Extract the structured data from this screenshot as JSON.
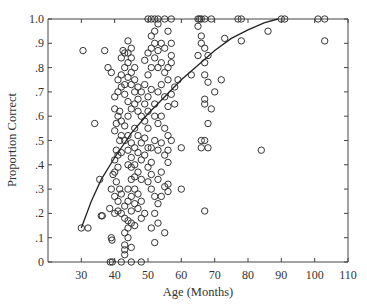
{
  "chart_data": {
    "type": "scatter",
    "title": "",
    "xlabel": "Age (Months)",
    "ylabel": "Proportion Correct",
    "xlim": [
      20,
      110
    ],
    "ylim": [
      0,
      1.0
    ],
    "x_ticks": [
      30,
      40,
      50,
      60,
      70,
      80,
      90,
      100,
      110
    ],
    "x_tick_labels": [
      "30",
      "40",
      "50",
      "60",
      "70",
      "80",
      "90",
      "100",
      "110"
    ],
    "y_ticks": [
      0,
      0.1,
      0.2,
      0.3,
      0.4,
      0.5,
      0.6,
      0.7,
      0.8,
      0.9,
      1.0
    ],
    "y_tick_labels": [
      "0",
      ".1",
      ".2",
      ".3",
      ".4",
      ".5",
      ".6",
      ".7",
      ".8",
      ".9",
      "1.0"
    ],
    "grid": false,
    "legend": null,
    "fit_curve": {
      "description": "monotone increasing fitted curve",
      "points": [
        [
          30,
          0.14
        ],
        [
          33,
          0.25
        ],
        [
          36,
          0.34
        ],
        [
          40,
          0.43
        ],
        [
          45,
          0.53
        ],
        [
          50,
          0.61
        ],
        [
          55,
          0.68
        ],
        [
          60,
          0.75
        ],
        [
          65,
          0.81
        ],
        [
          70,
          0.87
        ],
        [
          75,
          0.92
        ],
        [
          80,
          0.955
        ],
        [
          85,
          0.985
        ],
        [
          89,
          1.0
        ]
      ]
    },
    "series": [
      {
        "name": "children",
        "points": [
          [
            30,
            0.14
          ],
          [
            32,
            0.14
          ],
          [
            30.5,
            0.87
          ],
          [
            37,
            0.87
          ],
          [
            34,
            0.57
          ],
          [
            36,
            0.19
          ],
          [
            36.3,
            0.19
          ],
          [
            35.5,
            0.34
          ],
          [
            38,
            0.8
          ],
          [
            39,
            0.78
          ],
          [
            38.5,
            0.22
          ],
          [
            39,
            0.1
          ],
          [
            39.2,
            0.09
          ],
          [
            38.7,
            0.0
          ],
          [
            39.3,
            0.0
          ],
          [
            42,
            0.0
          ],
          [
            45,
            0.0
          ],
          [
            48,
            0.0
          ],
          [
            39.5,
            0.36
          ],
          [
            40,
            0.37
          ],
          [
            40.5,
            0.33
          ],
          [
            41,
            0.39
          ],
          [
            41.5,
            0.3
          ],
          [
            42,
            0.28
          ],
          [
            39,
            0.3
          ],
          [
            40,
            0.27
          ],
          [
            41,
            0.25
          ],
          [
            43,
            0.23
          ],
          [
            40,
            0.2
          ],
          [
            41,
            0.21
          ],
          [
            42,
            0.2
          ],
          [
            43,
            0.18
          ],
          [
            44,
            0.17
          ],
          [
            45,
            0.16
          ],
          [
            46,
            0.15
          ],
          [
            44,
            0.14
          ],
          [
            43,
            0.12
          ],
          [
            44,
            0.1
          ],
          [
            43,
            0.07
          ],
          [
            43,
            0.05
          ],
          [
            43,
            0.03
          ],
          [
            45,
            0.06
          ],
          [
            40,
            0.42
          ],
          [
            41,
            0.44
          ],
          [
            42,
            0.45
          ],
          [
            40.5,
            0.46
          ],
          [
            41.5,
            0.5
          ],
          [
            42,
            0.52
          ],
          [
            43,
            0.5
          ],
          [
            44,
            0.52
          ],
          [
            45,
            0.49
          ],
          [
            46,
            0.47
          ],
          [
            40,
            0.54
          ],
          [
            40.5,
            0.57
          ],
          [
            41,
            0.6
          ],
          [
            41.5,
            0.62
          ],
          [
            42,
            0.58
          ],
          [
            43,
            0.56
          ],
          [
            44,
            0.6
          ],
          [
            45,
            0.63
          ],
          [
            44,
            0.66
          ],
          [
            43,
            0.69
          ],
          [
            40,
            0.63
          ],
          [
            40,
            0.68
          ],
          [
            41,
            0.7
          ],
          [
            42,
            0.72
          ],
          [
            43,
            0.73
          ],
          [
            41,
            0.75
          ],
          [
            42,
            0.77
          ],
          [
            43,
            0.8
          ],
          [
            44,
            0.82
          ],
          [
            42,
            0.84
          ],
          [
            43,
            0.86
          ],
          [
            44,
            0.86
          ],
          [
            42.5,
            0.87
          ],
          [
            45,
            0.84
          ],
          [
            44,
            0.76
          ],
          [
            45,
            0.73
          ],
          [
            46,
            0.7
          ],
          [
            44,
            0.91
          ],
          [
            45,
            0.88
          ],
          [
            46,
            0.8
          ],
          [
            45,
            0.78
          ],
          [
            46,
            0.75
          ],
          [
            47,
            0.72
          ],
          [
            48,
            0.7
          ],
          [
            47,
            0.67
          ],
          [
            46,
            0.65
          ],
          [
            47,
            0.62
          ],
          [
            48,
            0.6
          ],
          [
            46,
            0.55
          ],
          [
            47,
            0.52
          ],
          [
            48,
            0.49
          ],
          [
            47,
            0.45
          ],
          [
            48,
            0.42
          ],
          [
            46,
            0.4
          ],
          [
            47,
            0.37
          ],
          [
            48,
            0.34
          ],
          [
            46,
            0.3
          ],
          [
            47,
            0.28
          ],
          [
            48,
            0.25
          ],
          [
            47,
            0.22
          ],
          [
            49,
            0.2
          ],
          [
            48,
            0.18
          ],
          [
            46,
            0.35
          ],
          [
            45,
            0.39
          ],
          [
            45,
            0.43
          ],
          [
            44,
            0.46
          ],
          [
            44,
            0.4
          ],
          [
            45,
            0.34
          ],
          [
            44,
            0.3
          ],
          [
            45,
            0.27
          ],
          [
            46,
            0.24
          ],
          [
            45,
            0.21
          ],
          [
            44,
            0.25
          ],
          [
            49,
            0.44
          ],
          [
            50,
            0.47
          ],
          [
            49,
            0.51
          ],
          [
            50,
            0.55
          ],
          [
            49,
            0.58
          ],
          [
            50,
            0.62
          ],
          [
            49,
            0.65
          ],
          [
            50,
            0.68
          ],
          [
            51,
            0.71
          ],
          [
            49,
            0.73
          ],
          [
            50,
            0.77
          ],
          [
            51,
            0.8
          ],
          [
            49,
            0.83
          ],
          [
            50,
            0.86
          ],
          [
            51,
            0.88
          ],
          [
            52,
            0.9
          ],
          [
            51,
            0.93
          ],
          [
            52,
            0.95
          ],
          [
            53,
            0.98
          ],
          [
            51,
            1.0
          ],
          [
            52,
            1.0
          ],
          [
            53,
            1.0
          ],
          [
            50,
            1.0
          ],
          [
            55,
            1.0
          ],
          [
            57,
            1.0
          ],
          [
            52,
            0.84
          ],
          [
            53,
            0.87
          ],
          [
            54,
            0.9
          ],
          [
            55,
            0.88
          ],
          [
            54,
            0.82
          ],
          [
            53,
            0.8
          ],
          [
            55,
            0.78
          ],
          [
            56,
            0.75
          ],
          [
            54,
            0.73
          ],
          [
            53,
            0.7
          ],
          [
            55,
            0.68
          ],
          [
            56,
            0.64
          ],
          [
            54,
            0.6
          ],
          [
            53,
            0.57
          ],
          [
            55,
            0.55
          ],
          [
            56,
            0.52
          ],
          [
            54,
            0.49
          ],
          [
            53,
            0.46
          ],
          [
            55,
            0.44
          ],
          [
            56,
            0.41
          ],
          [
            54,
            0.37
          ],
          [
            53,
            0.34
          ],
          [
            55,
            0.31
          ],
          [
            51,
            0.3
          ],
          [
            52,
            0.27
          ],
          [
            53,
            0.24
          ],
          [
            52,
            0.2
          ],
          [
            53,
            0.16
          ],
          [
            55,
            0.12
          ],
          [
            52,
            0.08
          ],
          [
            50,
            0.33
          ],
          [
            50,
            0.39
          ],
          [
            51,
            0.41
          ],
          [
            51,
            0.36
          ],
          [
            51,
            0.14
          ],
          [
            56,
            0.95
          ],
          [
            57,
            0.9
          ],
          [
            57,
            0.85
          ],
          [
            57,
            0.82
          ],
          [
            56,
            0.8
          ],
          [
            58,
            0.72
          ],
          [
            57,
            0.69
          ],
          [
            58,
            0.65
          ],
          [
            56,
            0.29
          ],
          [
            56,
            0.32
          ],
          [
            54,
            0.27
          ],
          [
            57,
            0.5
          ],
          [
            56,
            0.46
          ],
          [
            59,
            0.75
          ],
          [
            60,
            0.47
          ],
          [
            60,
            0.3
          ],
          [
            63,
            0.77
          ],
          [
            65,
            1.0
          ],
          [
            65.5,
            1.0
          ],
          [
            66,
            1.0
          ],
          [
            67,
            1.0
          ],
          [
            69,
            1.0
          ],
          [
            65,
            0.97
          ],
          [
            66,
            0.93
          ],
          [
            66,
            0.9
          ],
          [
            67,
            0.88
          ],
          [
            65,
            0.85
          ],
          [
            67,
            0.82
          ],
          [
            68,
            0.85
          ],
          [
            67,
            0.77
          ],
          [
            68,
            0.74
          ],
          [
            70,
            0.7
          ],
          [
            67,
            0.67
          ],
          [
            67,
            0.65
          ],
          [
            68,
            0.57
          ],
          [
            67,
            0.5
          ],
          [
            66,
            0.5
          ],
          [
            66,
            0.47
          ],
          [
            68,
            0.47
          ],
          [
            67,
            0.21
          ],
          [
            69,
            0.63
          ],
          [
            73,
            0.92
          ],
          [
            72,
            0.75
          ],
          [
            77,
            1.0
          ],
          [
            78,
            1.0
          ],
          [
            78,
            0.91
          ],
          [
            84,
            0.46
          ],
          [
            86,
            0.95
          ],
          [
            90,
            1.0
          ],
          [
            91,
            1.0
          ],
          [
            101,
            1.0
          ],
          [
            103,
            1.0
          ],
          [
            103,
            0.91
          ],
          [
            52,
            0.65
          ],
          [
            52,
            0.6
          ],
          [
            52,
            0.5
          ],
          [
            51,
            0.47
          ]
        ]
      }
    ]
  }
}
